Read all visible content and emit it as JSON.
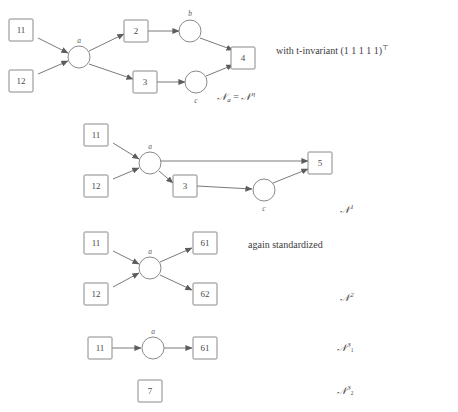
{
  "figure": {
    "background": "#ffffff",
    "stroke_color": "#8a8a8a",
    "edge_color": "#7a7a7a",
    "text_color": "#3d3d3d"
  },
  "annotations": {
    "t_invariant": "with t-invariant (1 1 1 1 1)",
    "t_invariant_exponent": "⊤",
    "again_standardized": "again standardized"
  },
  "net_labels": {
    "net0_base": "𝒩",
    "net0_sub": "a",
    "net0_eq": " = ",
    "net0_base2": "𝒩",
    "net0_sup": "η",
    "net1_base": "𝒩",
    "net1_sup": "1",
    "net2_base": "𝒩",
    "net2_sup": "2",
    "net31_base": "𝒩",
    "net31_sup": "3",
    "net31_supsub": "1",
    "net32_base": "𝒩",
    "net32_sup": "3",
    "net32_supsub": "2"
  },
  "diagrams": [
    {
      "id": "net-0",
      "places": [
        {
          "label": "11",
          "x": 22,
          "y": 30
        },
        {
          "label": "12",
          "x": 22,
          "y": 81
        },
        {
          "label": "2",
          "x": 136,
          "y": 31
        },
        {
          "label": "3",
          "x": 145,
          "y": 82
        },
        {
          "label": "4",
          "x": 243,
          "y": 58
        }
      ],
      "transitions": [
        {
          "label": "a",
          "x": 79,
          "y": 57
        },
        {
          "label": "b",
          "x": 190,
          "y": 31
        },
        {
          "label": "c",
          "x": 196,
          "y": 82
        }
      ]
    },
    {
      "id": "net-1",
      "places": [
        {
          "label": "11",
          "x": 96,
          "y": 135
        },
        {
          "label": "12",
          "x": 96,
          "y": 186
        },
        {
          "label": "3",
          "x": 185,
          "y": 186
        },
        {
          "label": "5",
          "x": 320,
          "y": 163
        }
      ],
      "transitions": [
        {
          "label": "a",
          "x": 150,
          "y": 163
        },
        {
          "label": "c",
          "x": 264,
          "y": 190
        }
      ]
    },
    {
      "id": "net-2",
      "places": [
        {
          "label": "11",
          "x": 96,
          "y": 243
        },
        {
          "label": "12",
          "x": 96,
          "y": 294
        },
        {
          "label": "61",
          "x": 205,
          "y": 243
        },
        {
          "label": "62",
          "x": 205,
          "y": 294
        }
      ],
      "transitions": [
        {
          "label": "a",
          "x": 150,
          "y": 268
        }
      ]
    },
    {
      "id": "net-31",
      "places": [
        {
          "label": "11",
          "x": 100,
          "y": 348
        },
        {
          "label": "61",
          "x": 205,
          "y": 348
        }
      ],
      "transitions": [
        {
          "label": "a",
          "x": 153,
          "y": 348
        }
      ]
    },
    {
      "id": "net-32",
      "places": [
        {
          "label": "7",
          "x": 150,
          "y": 391
        }
      ],
      "transitions": []
    }
  ]
}
